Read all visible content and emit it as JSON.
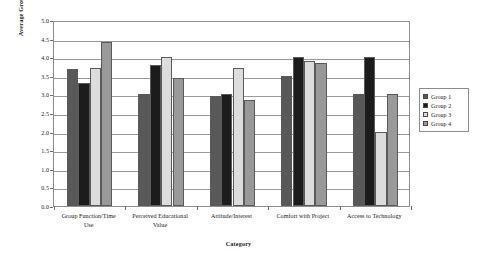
{
  "chart_data": {
    "type": "bar",
    "title": "",
    "xlabel": "Category",
    "ylabel": "Average Group Response",
    "ylim": [
      0.0,
      5.0
    ],
    "ytick_labels": [
      "5.0",
      "4.5",
      "4.0",
      "3.5",
      "3.0",
      "2.5",
      "2.0",
      "1.5",
      "1.0",
      "0.5",
      "0.0"
    ],
    "ytick_values": [
      5.0,
      4.5,
      4.0,
      3.5,
      3.0,
      2.5,
      2.0,
      1.5,
      1.0,
      0.5,
      0.0
    ],
    "grid": true,
    "legend_position": "right",
    "categories": [
      "Group Function/Time Use",
      "Perceived Educational Value",
      "Attitude/Interest",
      "Comfort with Project",
      "Access to Technology"
    ],
    "category_lines": [
      [
        "Group Function/Time",
        "Use"
      ],
      [
        "Perceived Educational",
        "Value"
      ],
      [
        "Attitude/Interest"
      ],
      [
        "Comfort with Project"
      ],
      [
        "Access to Technology"
      ]
    ],
    "series": [
      {
        "name": "Group 1",
        "color": "#585858",
        "values": [
          3.67,
          3.0,
          2.95,
          3.5,
          3.0
        ]
      },
      {
        "name": "Group 2",
        "color": "#1c1c1c",
        "values": [
          3.31,
          3.78,
          3.02,
          4.0,
          4.0
        ]
      },
      {
        "name": "Group 3",
        "color": "#dcdcdc",
        "values": [
          3.71,
          4.0,
          3.7,
          3.9,
          2.0
        ]
      },
      {
        "name": "Group 4",
        "color": "#999999",
        "values": [
          4.41,
          3.45,
          2.85,
          3.85,
          3.0
        ]
      }
    ]
  },
  "legend": {
    "items": [
      {
        "label": "Group 1",
        "color": "#585858"
      },
      {
        "label": "Group 2",
        "color": "#1c1c1c"
      },
      {
        "label": "Group 3",
        "color": "#dcdcdc"
      },
      {
        "label": "Group 4",
        "color": "#999999"
      }
    ]
  }
}
